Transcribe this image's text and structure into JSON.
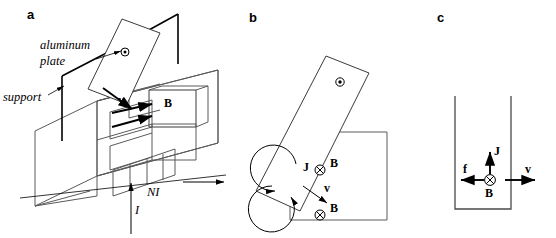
{
  "figure": {
    "caption_panels": [
      "a",
      "b",
      "c"
    ],
    "colors": {
      "stroke_light": "#5a5a5a",
      "stroke_dark": "#3a3a3a",
      "ink": "#000000",
      "background": "#ffffff"
    }
  },
  "panel_a": {
    "label": "a",
    "annotations": {
      "aluminum_plate_line1": "aluminum",
      "aluminum_plate_line2": "plate",
      "support": "support",
      "field_label": "B",
      "velocity_label": "v",
      "coil_current_label": "NI",
      "current_label": "I"
    }
  },
  "panel_b": {
    "label": "b",
    "annotations": {
      "current_density_label": "J",
      "velocity_label": "v",
      "field_label_upper": "B",
      "field_label_lower": "B"
    },
    "symbols": {
      "plate_axis": "dot-in-circle-icon",
      "field_into_page_upper": "cross-in-circle-icon",
      "field_into_page_lower": "cross-in-circle-icon"
    }
  },
  "panel_c": {
    "label": "c",
    "annotations": {
      "current_density_label": "J",
      "force_label": "f",
      "velocity_label": "v",
      "field_label": "B"
    },
    "symbols": {
      "field_into_page": "cross-in-circle-icon"
    }
  }
}
